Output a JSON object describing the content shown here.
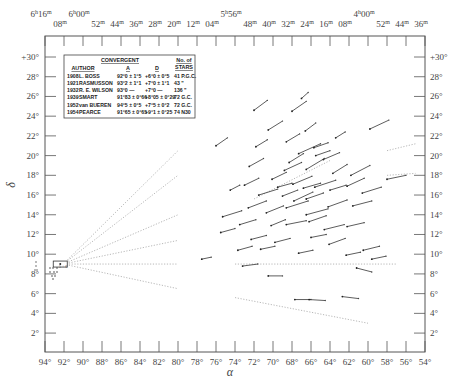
{
  "chart_data": {
    "type": "scatter",
    "title": "",
    "xlabel": "α",
    "ylabel": "δ",
    "xlim": [
      94,
      54
    ],
    "ylim": [
      1,
      31
    ],
    "grid": false,
    "x_ticks_bottom": [
      "94°",
      "92°",
      "90°",
      "88°",
      "86°",
      "84°",
      "82°",
      "80°",
      "78°",
      "76°",
      "74°",
      "72°",
      "70°",
      "68°",
      "66°",
      "64°",
      "62°",
      "60°",
      "58°",
      "56°",
      "54°"
    ],
    "x_ticks_top": [
      "6h16m",
      "08m",
      "6h00m",
      "52m",
      "44m",
      "36m",
      "28m",
      "20m",
      "12m",
      "04m",
      "5h56m",
      "48m",
      "40m",
      "32m",
      "24m",
      "16m",
      "08m",
      "4h00m",
      "52m",
      "44m",
      "36m"
    ],
    "y_ticks": [
      "2°",
      "4°",
      "6°",
      "8°",
      "10°",
      "12°",
      "14°",
      "16°",
      "18°",
      "20°",
      "22°",
      "24°",
      "26°",
      "28°",
      "+30°"
    ],
    "convergent_point": {
      "alpha": 92.5,
      "delta": 9.0
    },
    "legend_table": {
      "header": {
        "group": "CONVERGENT",
        "author": "AUTHOR",
        "a": "A",
        "d": "D",
        "stars_line1": "No. of",
        "stars_line2": "STARS"
      },
      "rows": [
        {
          "year": "1908",
          "author": "L. BOSS",
          "a": "92°0 ± 1°5",
          "d": "+6°0 ± 0°5",
          "stars": "41 P.G.C."
        },
        {
          "year": "1921",
          "author": "RASMUSSON",
          "a": "93°2 ± 1°1",
          "d": "+7°0 ± 1°1",
          "stars": "43 \""
        },
        {
          "year": "1932",
          "author": "R. E. WILSON",
          "a": "93°0  —",
          "d": "+7°0  —",
          "stars": "136 \""
        },
        {
          "year": "1939",
          "author": "SMART",
          "a": "91°83 ± 0°66",
          "d": "+8°05 ± 0°29",
          "stars": "72 G.C."
        },
        {
          "year": "1952",
          "author": "van BUEREN",
          "a": "94°5 ± 0°5",
          "d": "+7°5 ± 0°2",
          "stars": "72 G.C."
        },
        {
          "year": "1954",
          "author": "PEARCE",
          "a": "91°65 ± 0°65",
          "d": "+9°1 ± 0°25",
          "stars": "74 N30"
        }
      ]
    },
    "convergence_lines": [
      {
        "from": [
          92.5,
          9.0
        ],
        "to": [
          80,
          20.5
        ]
      },
      {
        "from": [
          92.5,
          9.0
        ],
        "to": [
          80,
          18.0
        ]
      },
      {
        "from": [
          92.5,
          9.0
        ],
        "to": [
          80,
          14.0
        ]
      },
      {
        "from": [
          92.5,
          9.0
        ],
        "to": [
          80,
          11.4
        ]
      },
      {
        "from": [
          92.5,
          9.0
        ],
        "to": [
          80,
          9.0
        ]
      },
      {
        "from": [
          92.5,
          9.0
        ],
        "to": [
          80,
          6.5
        ]
      }
    ],
    "extended_lines": [
      {
        "from": [
          74,
          9.0
        ],
        "to": [
          57,
          9.0
        ]
      },
      {
        "from": [
          74,
          5.6
        ],
        "to": [
          60,
          3.0
        ]
      },
      {
        "from": [
          72,
          15.6
        ],
        "to": [
          64,
          19.5
        ]
      },
      {
        "from": [
          58,
          20.5
        ],
        "to": [
          55,
          21.2
        ]
      },
      {
        "from": [
          58,
          18.0
        ],
        "to": [
          55,
          18.2
        ]
      }
    ],
    "proper_motion_vectors": [
      [
        76.0,
        21.0,
        74.8,
        21.8
      ],
      [
        72.0,
        24.6,
        70.6,
        25.6
      ],
      [
        68.0,
        24.5,
        66.5,
        25.5
      ],
      [
        67.0,
        25.8,
        66.3,
        26.4
      ],
      [
        74.5,
        16.5,
        73.5,
        17.0
      ],
      [
        70.5,
        22.6,
        69.0,
        23.5
      ],
      [
        66.6,
        22.5,
        65.5,
        23.3
      ],
      [
        63.4,
        21.8,
        62.4,
        22.4
      ],
      [
        59.8,
        22.7,
        57.8,
        23.6
      ],
      [
        68.6,
        21.4,
        67.2,
        22.2
      ],
      [
        71.8,
        20.9,
        70.6,
        21.6
      ],
      [
        67.3,
        20.2,
        65.0,
        21.2
      ],
      [
        65.7,
        20.8,
        64.2,
        21.3
      ],
      [
        64.7,
        19.6,
        63.0,
        20.3
      ],
      [
        72.5,
        18.9,
        71.0,
        19.7
      ],
      [
        68.3,
        19.3,
        66.8,
        20.2
      ],
      [
        66.5,
        18.6,
        64.6,
        19.7
      ],
      [
        63.7,
        18.2,
        62.2,
        19.1
      ],
      [
        61.8,
        18.0,
        59.8,
        19.0
      ],
      [
        58.0,
        17.6,
        56.0,
        18.0
      ],
      [
        73.0,
        17.0,
        71.5,
        17.7
      ],
      [
        70.1,
        17.6,
        68.6,
        18.3
      ],
      [
        67.9,
        17.1,
        65.9,
        17.9
      ],
      [
        65.6,
        16.8,
        63.4,
        17.5
      ],
      [
        62.2,
        16.9,
        60.4,
        17.7
      ],
      [
        60.6,
        16.2,
        58.6,
        16.8
      ],
      [
        71.5,
        16.0,
        69.5,
        16.6
      ],
      [
        69.0,
        15.9,
        67.4,
        16.5
      ],
      [
        67.8,
        15.4,
        65.8,
        16.3
      ],
      [
        66.5,
        15.6,
        64.7,
        16.2
      ],
      [
        64.2,
        14.8,
        62.2,
        15.5
      ],
      [
        61.6,
        14.9,
        59.6,
        15.4
      ],
      [
        72.6,
        14.7,
        70.7,
        15.4
      ],
      [
        70.7,
        14.2,
        68.9,
        14.9
      ],
      [
        68.6,
        14.7,
        66.3,
        15.4
      ],
      [
        66.5,
        14.0,
        64.2,
        14.6
      ],
      [
        75.3,
        13.8,
        73.3,
        14.4
      ],
      [
        73.5,
        13.0,
        71.8,
        13.5
      ],
      [
        70.2,
        12.9,
        68.7,
        13.5
      ],
      [
        68.6,
        13.0,
        66.5,
        13.4
      ],
      [
        66.2,
        13.3,
        64.4,
        13.9
      ],
      [
        64.6,
        12.5,
        62.5,
        13.0
      ],
      [
        62.2,
        12.8,
        60.4,
        13.2
      ],
      [
        75.5,
        12.2,
        74.0,
        12.6
      ],
      [
        72.3,
        11.5,
        70.7,
        11.9
      ],
      [
        69.8,
        11.2,
        68.2,
        11.6
      ],
      [
        66.0,
        11.7,
        64.4,
        12.0
      ],
      [
        64.1,
        11.0,
        62.4,
        11.6
      ],
      [
        60.5,
        10.4,
        58.8,
        10.8
      ],
      [
        73.7,
        10.4,
        72.2,
        10.8
      ],
      [
        71.3,
        10.5,
        69.8,
        10.8
      ],
      [
        67.3,
        10.1,
        65.8,
        10.4
      ],
      [
        62.3,
        9.9,
        60.8,
        10.2
      ],
      [
        59.6,
        9.5,
        58.1,
        9.8
      ],
      [
        77.5,
        9.5,
        76.5,
        9.7
      ],
      [
        73.2,
        8.8,
        71.6,
        9.0
      ],
      [
        61.2,
        8.6,
        59.6,
        8.2
      ],
      [
        70.5,
        7.8,
        69.0,
        7.8
      ],
      [
        67.7,
        5.4,
        66.0,
        5.4
      ],
      [
        66.2,
        5.4,
        64.5,
        5.3
      ],
      [
        62.7,
        5.7,
        61.0,
        5.5
      ],
      [
        65.5,
        20.0,
        64.0,
        20.5
      ],
      [
        68.8,
        18.5,
        67.0,
        19.3
      ],
      [
        66.8,
        16.7,
        65.0,
        17.2
      ],
      [
        64.0,
        16.5,
        62.3,
        17.0
      ],
      [
        69.5,
        16.8,
        68.0,
        17.2
      ]
    ]
  }
}
